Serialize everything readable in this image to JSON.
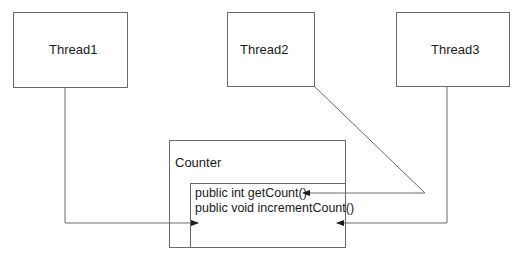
{
  "diagram": {
    "threads": [
      {
        "label": "Thread1"
      },
      {
        "label": "Thread2"
      },
      {
        "label": "Thread3"
      }
    ],
    "counter": {
      "label": "Counter",
      "methods": [
        {
          "signature": "public int getCount()"
        },
        {
          "signature": "public void incrementCount()"
        }
      ]
    },
    "connections": [
      {
        "from": "Thread1",
        "to": "Counter"
      },
      {
        "from": "Thread2",
        "to": "getCount()"
      },
      {
        "from": "Thread3",
        "to": "Counter"
      }
    ],
    "colors": {
      "stroke": "#6a6a6a",
      "text": "#1a1a1a",
      "background": "#ffffff"
    }
  }
}
